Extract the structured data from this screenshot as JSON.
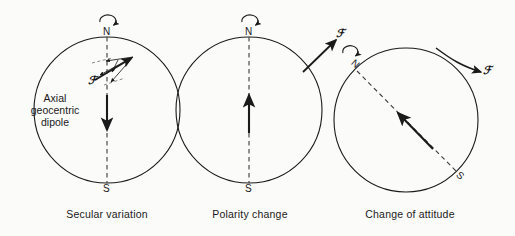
{
  "figure": {
    "background_color": "#fbfbf9",
    "stroke_color": "#1a1a1a",
    "panels": [
      {
        "id": "secular-variation",
        "caption": "Secular variation",
        "north_label": "N",
        "south_label": "S",
        "dipole_label_lines": [
          "Axial",
          "geocentric",
          "dipole"
        ],
        "field_symbol": "ℱ",
        "rotation_icon": "rotation-arrow",
        "dipole_direction": "down",
        "circle": {
          "cx": 107,
          "cy": 110,
          "r": 73
        },
        "axis": {
          "x1": 107,
          "y1": 37,
          "x2": 107,
          "y2": 183,
          "style": "dashed"
        },
        "dipole_arrow": {
          "x1": 107,
          "y1": 95,
          "x2": 107,
          "y2": 133
        },
        "vectors": [
          {
            "x1": 96,
            "y1": 79,
            "x2": 133,
            "y2": 57
          },
          {
            "x1": 96,
            "y1": 79,
            "x2": 133,
            "y2": 57,
            "variant": "thin-up"
          },
          {
            "x1": 133,
            "y1": 57,
            "x2": 104,
            "y2": 62
          },
          {
            "x1": 133,
            "y1": 57,
            "x2": 99,
            "y2": 76
          },
          {
            "x1": 133,
            "y1": 57,
            "x2": 110,
            "y2": 83
          }
        ]
      },
      {
        "id": "polarity-change",
        "caption": "Polarity change",
        "north_label": "N",
        "south_label": "S",
        "field_symbol": "ℱ",
        "rotation_icon": "rotation-arrow",
        "dipole_direction": "up",
        "circle": {
          "cx": 249,
          "cy": 110,
          "r": 73
        },
        "axis": {
          "x1": 249,
          "y1": 37,
          "x2": 249,
          "y2": 183,
          "style": "dashed"
        },
        "dipole_arrow": {
          "x1": 249,
          "y1": 133,
          "x2": 249,
          "y2": 93
        },
        "external_vector": {
          "x1": 305,
          "y1": 70,
          "x2": 338,
          "y2": 38
        }
      },
      {
        "id": "change-of-attitude",
        "caption": "Change of attitude",
        "north_label": "N",
        "south_label": "S",
        "field_symbol": "ℱ",
        "rotation_icon": "rotation-arrow-tilted",
        "dipole_direction": "oblique-up-left",
        "circle": {
          "cx": 406,
          "cy": 120,
          "r": 72
        },
        "axis": {
          "x1": 355,
          "y1": 70,
          "x2": 458,
          "y2": 172,
          "style": "dashed"
        },
        "dipole_arrow": {
          "x1": 432,
          "y1": 148,
          "x2": 397,
          "y2": 112
        },
        "external_vector": {
          "x1": 450,
          "y1": 57,
          "x2": 487,
          "y2": 74
        }
      }
    ]
  }
}
